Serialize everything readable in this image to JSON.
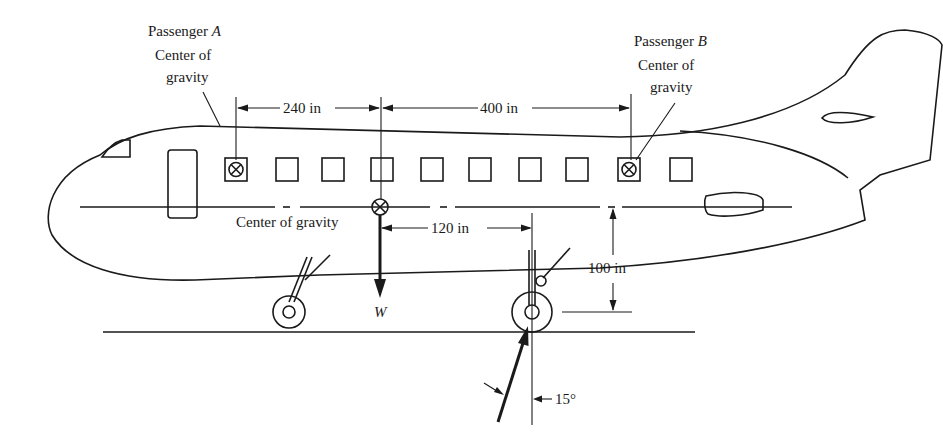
{
  "diagram": {
    "labels": {
      "passenger_a_line1": "Passenger ",
      "passenger_a_letter": "A",
      "passenger_a_line2": "Center of",
      "passenger_a_line3": "gravity",
      "passenger_b_line1": "Passenger ",
      "passenger_b_letter": "B",
      "passenger_b_line2": "Center of",
      "passenger_b_line3": "gravity",
      "center_of_gravity": "Center of gravity",
      "weight": "W",
      "dim_240": "240 in",
      "dim_400": "400 in",
      "dim_120": "120 in",
      "dim_100": "100 in",
      "angle_15": "15°"
    },
    "windows_count": 10,
    "colors": {
      "ink": "#1a1a1a",
      "background": "#ffffff"
    }
  }
}
